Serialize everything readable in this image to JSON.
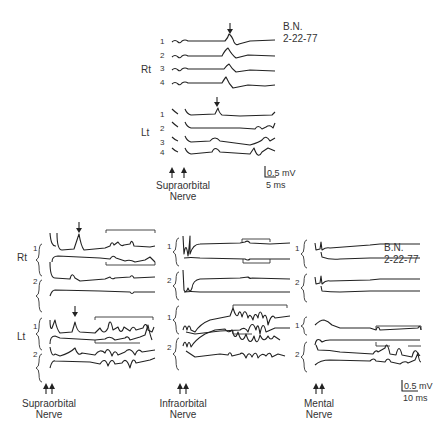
{
  "figure": {
    "top_panel": {
      "subject_label": "B.N.",
      "date_label": "2-22-77",
      "sides": [
        {
          "label": "Rt",
          "trace_numbers": [
            "1",
            "2",
            "3",
            "4"
          ]
        },
        {
          "label": "Lt",
          "trace_numbers": [
            "1",
            "2",
            "3",
            "4"
          ]
        }
      ],
      "stimulus_label_line1": "Supraorbital",
      "stimulus_label_line2": "Nerve",
      "scale_bar": {
        "amplitude": "0.5 mV",
        "time": "5 ms"
      }
    },
    "bottom_panel": {
      "subject_label": "B.N.",
      "date_label": "2-22-77",
      "row_labels": [
        "Rt",
        "Lt"
      ],
      "pair_numbers": [
        "1",
        "2"
      ],
      "columns": [
        {
          "stimulus_line1": "Supraorbital",
          "stimulus_line2": "Nerve"
        },
        {
          "stimulus_line1": "Infraorbital",
          "stimulus_line2": "Nerve"
        },
        {
          "stimulus_line1": "Mental",
          "stimulus_line2": "Nerve"
        }
      ],
      "scale_bar": {
        "amplitude": "0.5 mV",
        "time": "10 ms"
      }
    }
  }
}
